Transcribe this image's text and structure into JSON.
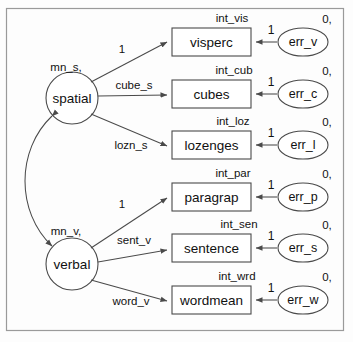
{
  "diagram": {
    "type": "sem-path-diagram",
    "title": "",
    "frame": {
      "visible": true,
      "color": "#9a9a9a"
    },
    "colors": {
      "stroke": "#4a4a4a",
      "text": "#111111",
      "background": "#fdfdfd",
      "frame": "#9a9a9a"
    },
    "latent_factors": [
      {
        "id": "spatial",
        "label": "spatial",
        "mean_label": "mn_s,",
        "cx": 72,
        "cy": 98,
        "r": 26
      },
      {
        "id": "verbal",
        "label": "verbal",
        "mean_label": "mn_v,",
        "cx": 72,
        "cy": 264,
        "r": 26
      }
    ],
    "observed_variables": [
      {
        "id": "visperc",
        "label": "visperc",
        "intercept_label": "int_vis",
        "x": 172,
        "y": 28,
        "w": 79,
        "h": 28
      },
      {
        "id": "cubes",
        "label": "cubes",
        "intercept_label": "int_cub",
        "x": 172,
        "y": 80,
        "w": 79,
        "h": 28
      },
      {
        "id": "lozenges",
        "label": "lozenges",
        "intercept_label": "int_loz",
        "x": 172,
        "y": 131,
        "w": 79,
        "h": 28
      },
      {
        "id": "paragrap",
        "label": "paragrap",
        "intercept_label": "int_par",
        "x": 172,
        "y": 183,
        "w": 79,
        "h": 28
      },
      {
        "id": "sentence",
        "label": "sentence",
        "intercept_label": "int_sen",
        "x": 172,
        "y": 234,
        "w": 79,
        "h": 28
      },
      {
        "id": "wordmean",
        "label": "wordmean",
        "intercept_label": "int_wrd",
        "x": 172,
        "y": 286,
        "w": 79,
        "h": 28
      }
    ],
    "error_terms": [
      {
        "id": "err_v",
        "label": "err_v",
        "variance_label": "0,",
        "loading_label": "1",
        "cx": 303,
        "cy": 42,
        "rx": 25,
        "ry": 14
      },
      {
        "id": "err_c",
        "label": "err_c",
        "variance_label": "0,",
        "loading_label": "1",
        "cx": 303,
        "cy": 94,
        "rx": 25,
        "ry": 14
      },
      {
        "id": "err_l",
        "label": "err_l",
        "variance_label": "0,",
        "loading_label": "1",
        "cx": 303,
        "cy": 145,
        "rx": 25,
        "ry": 14
      },
      {
        "id": "err_p",
        "label": "err_p",
        "variance_label": "0,",
        "loading_label": "1",
        "cx": 303,
        "cy": 197,
        "rx": 25,
        "ry": 14
      },
      {
        "id": "err_s",
        "label": "err_s",
        "variance_label": "0,",
        "loading_label": "1",
        "cx": 303,
        "cy": 248,
        "rx": 25,
        "ry": 14
      },
      {
        "id": "err_w",
        "label": "err_w",
        "variance_label": "0,",
        "loading_label": "1",
        "cx": 303,
        "cy": 300,
        "rx": 25,
        "ry": 14
      }
    ],
    "factor_loadings": [
      {
        "from": "spatial",
        "to": "visperc",
        "label": "1",
        "label_x": 122,
        "label_y": 50
      },
      {
        "from": "spatial",
        "to": "cubes",
        "label": "cube_s",
        "label_x": 134,
        "label_y": 86
      },
      {
        "from": "spatial",
        "to": "lozenges",
        "label": "lozn_s",
        "label_x": 131,
        "label_y": 146
      },
      {
        "from": "verbal",
        "to": "paragrap",
        "label": "1",
        "label_x": 122,
        "label_y": 205
      },
      {
        "from": "verbal",
        "to": "sentence",
        "label": "sent_v",
        "label_x": 134,
        "label_y": 241
      },
      {
        "from": "verbal",
        "to": "wordmean",
        "label": "word_v",
        "label_x": 131,
        "label_y": 302
      }
    ],
    "covariance": {
      "id": "spatial-verbal-covariance",
      "from": "spatial",
      "to": "verbal",
      "double_headed": true,
      "label": ""
    }
  }
}
